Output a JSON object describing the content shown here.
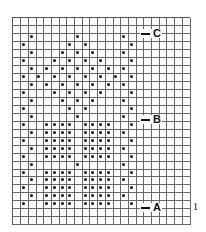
{
  "chart_data": {
    "type": "table",
    "title": "",
    "columns": 23,
    "rows": 26,
    "dot_rows": {
      "2": [
        2,
        8,
        14
      ],
      "3": [
        1,
        7,
        9,
        15
      ],
      "4": [
        2,
        6,
        8,
        10,
        14
      ],
      "5": [
        1,
        5,
        7,
        9,
        11,
        15
      ],
      "6": [
        2,
        4,
        6,
        8,
        10,
        12,
        14
      ],
      "7": [
        1,
        3,
        5,
        7,
        9,
        11,
        13,
        15
      ],
      "8": [
        2,
        4,
        6,
        8,
        10,
        12,
        14
      ],
      "9": [
        1,
        5,
        7,
        9,
        11,
        15
      ],
      "10": [
        2,
        6,
        8,
        10,
        14
      ],
      "11": [
        1,
        7,
        9,
        15
      ],
      "12": [
        2,
        8,
        14
      ],
      "13": [
        1,
        4,
        5,
        6,
        7,
        9,
        10,
        11,
        12,
        15
      ],
      "14": [
        2,
        4,
        5,
        6,
        7,
        9,
        10,
        11,
        12,
        14
      ],
      "15": [
        1,
        4,
        5,
        6,
        7,
        9,
        10,
        11,
        12,
        15
      ],
      "16": [
        2,
        4,
        5,
        6,
        7,
        9,
        10,
        11,
        12,
        14
      ],
      "17": [
        1,
        4,
        5,
        6,
        7,
        9,
        10,
        11,
        12,
        15
      ],
      "18": [
        2,
        8,
        14
      ],
      "19": [
        1,
        4,
        5,
        6,
        7,
        9,
        10,
        11,
        12,
        15
      ],
      "20": [
        2,
        4,
        5,
        6,
        7,
        9,
        10,
        11,
        12,
        14
      ],
      "21": [
        1,
        4,
        5,
        6,
        7,
        9,
        10,
        11,
        12,
        15
      ],
      "22": [
        2,
        4,
        5,
        6,
        7,
        9,
        10,
        11,
        12,
        14
      ],
      "23": [
        1,
        4,
        5,
        6,
        7,
        9,
        10,
        11,
        12,
        15
      ]
    },
    "markers": [
      {
        "label": "C",
        "row": 2
      },
      {
        "label": "B",
        "row": 12
      },
      {
        "label": "A",
        "row": 23
      }
    ],
    "row_number_label": {
      "text": "1",
      "row": 23
    }
  },
  "markers": {
    "c": "C",
    "b": "B",
    "a": "A"
  },
  "row_number": "1"
}
